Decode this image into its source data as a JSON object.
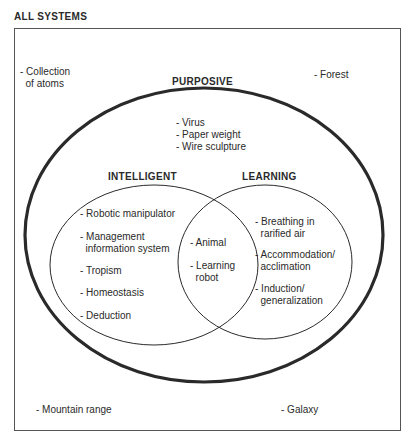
{
  "title": "ALL SYSTEMS",
  "sets": {
    "purposive": {
      "label": "PURPOSIVE",
      "items": [
        "- Virus",
        "- Paper weight",
        "- Wire sculpture"
      ]
    },
    "intelligent": {
      "label": "INTELLIGENT",
      "items": [
        "- Robotic manipulator",
        "- Management\n  information system",
        "- Tropism",
        "- Homeostasis",
        "- Deduction"
      ]
    },
    "learning": {
      "label": "LEARNING",
      "items": [
        "- Breathing in\n  rarified air",
        "- Accommodation/\n  acclimation",
        "- Induction/\n  generalization"
      ]
    },
    "intersection": {
      "items": [
        "- Animal",
        "- Learning\n  robot"
      ]
    }
  },
  "outside": [
    "- Collection\n  of atoms",
    "- Forest",
    "- Mountain range",
    "- Galaxy"
  ],
  "colors": {
    "line": "#2a2a2a",
    "frame": "#555555"
  }
}
